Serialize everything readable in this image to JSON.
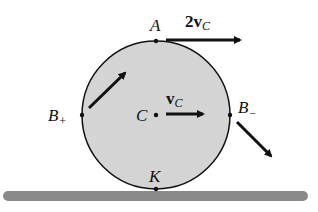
{
  "diagram": {
    "type": "rolling-disk-velocities",
    "colors": {
      "disk_fill": "#d4d4d4",
      "stroke": "#111111",
      "ground": "#8a8a8a",
      "background": "#ffffff"
    },
    "points": {
      "A": {
        "label": "A"
      },
      "C": {
        "label": "C"
      },
      "K": {
        "label": "K"
      },
      "B_plus": {
        "label": "B",
        "sub": "+"
      },
      "B_minus": {
        "label": "B",
        "sub": "−"
      }
    },
    "vectors": {
      "top": {
        "coef": "2",
        "symbol": "v",
        "sub": "C"
      },
      "center": {
        "symbol": "v",
        "sub": "C"
      }
    }
  }
}
